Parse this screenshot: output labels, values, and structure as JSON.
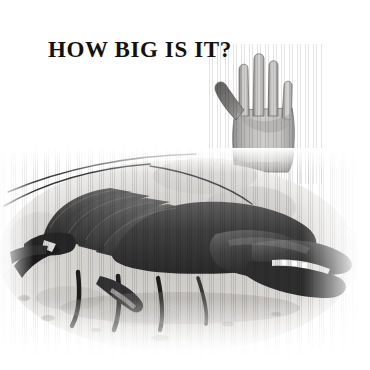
{
  "page": {
    "background_color": "#ffffff",
    "width": 370,
    "height": 370,
    "kind": "scale-comparison-illustration"
  },
  "title": {
    "text": "HOW BIG IS IT?",
    "color": "#14110f",
    "style": "serif-bold-uppercase"
  },
  "figures": {
    "hand": {
      "name": "human-hand-illustration",
      "description": "Open human hand, palm facing viewer, fingers up, thumb to the left",
      "shading": "grayscale halftone",
      "fill_color": "#c9c8c6",
      "shadow_color": "#6b6b6b",
      "outline_color": "#4a4a4a"
    },
    "lobster": {
      "name": "lobster-illustration",
      "description": "Lobster on sandy seabed, large claw to the right, long antennae sweeping upper-left",
      "shading": "grayscale engraving",
      "body_color": "#4d4d4d",
      "shell_dark": "#2b2b2b",
      "ground_color": "#d6d4d1"
    }
  },
  "palette": {
    "paper": "#ffffff",
    "ink": "#14110f",
    "mid_gray": "#8a8a8a",
    "light_gray": "#cfcecc",
    "dark_gray": "#3a3a3a"
  }
}
